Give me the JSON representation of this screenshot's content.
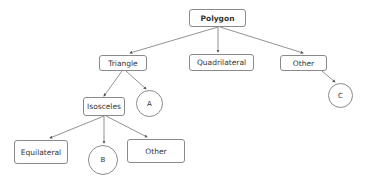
{
  "diagram": {
    "type": "tree",
    "nodes": {
      "polygon": {
        "label": "Polygon",
        "shape": "box"
      },
      "triangle": {
        "label": "Triangle",
        "shape": "box"
      },
      "quadrilateral": {
        "label": "Quadrilateral",
        "shape": "box"
      },
      "other_top": {
        "label": "Other",
        "shape": "box"
      },
      "isosceles": {
        "label": "Isosceles",
        "shape": "box"
      },
      "equilateral": {
        "label": "Equilateral",
        "shape": "box"
      },
      "other_bottom": {
        "label": "Other",
        "shape": "box"
      },
      "a": {
        "label": "A",
        "shape": "circle"
      },
      "b": {
        "label": "B",
        "shape": "circle"
      },
      "c": {
        "label": "C",
        "shape": "circle"
      }
    },
    "edges": [
      [
        "Polygon",
        "Triangle"
      ],
      [
        "Polygon",
        "Quadrilateral"
      ],
      [
        "Polygon",
        "Other"
      ],
      [
        "Triangle",
        "Isosceles"
      ],
      [
        "Triangle",
        "A"
      ],
      [
        "Other",
        "C"
      ],
      [
        "Isosceles",
        "Equilateral"
      ],
      [
        "Isosceles",
        "B"
      ],
      [
        "Isosceles",
        "Other"
      ]
    ],
    "colors": {
      "stroke": "#8a8a8a",
      "text": "#333333"
    }
  }
}
